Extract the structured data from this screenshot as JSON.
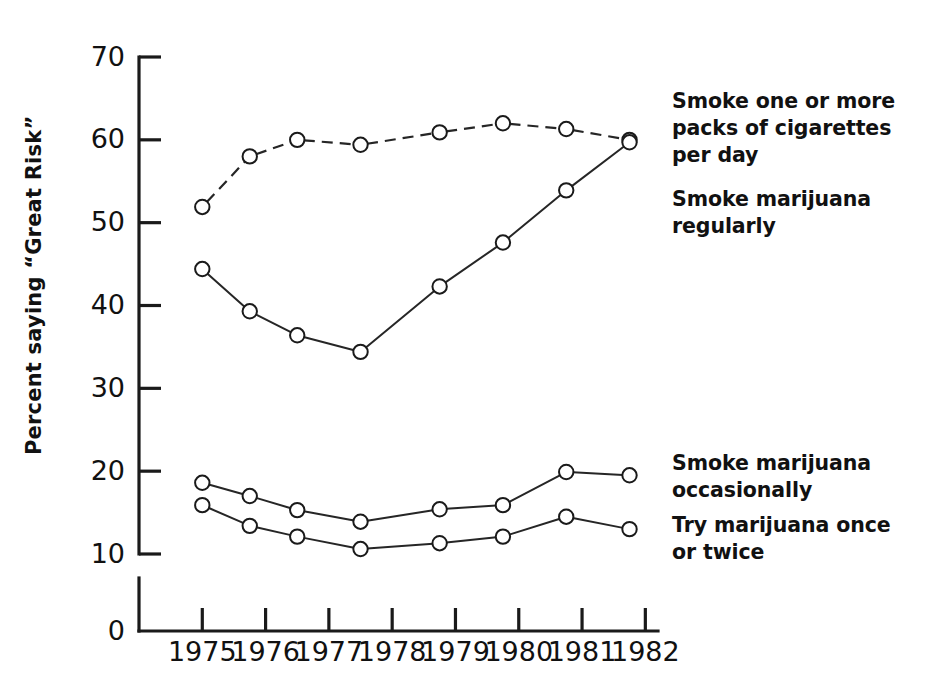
{
  "chart_data": {
    "type": "line",
    "title": "",
    "xlabel": "",
    "ylabel": "Percent saying “Great Risk”",
    "xlim": [
      1974.0,
      1982.2
    ],
    "ylim": [
      0,
      70
    ],
    "y_axis_break": true,
    "grid": false,
    "legend_position": "right",
    "xticks": [
      1975,
      1976,
      1977,
      1978,
      1979,
      1980,
      1981,
      1982
    ],
    "xtick_labels": [
      "1975",
      "1976",
      "1977",
      "1978",
      "1979",
      "1980",
      "1981",
      "1982"
    ],
    "yticks": [
      0,
      10,
      20,
      30,
      40,
      50,
      60,
      70
    ],
    "ytick_labels": [
      "0",
      "10",
      "20",
      "30",
      "40",
      "50",
      "60",
      "70"
    ],
    "series": [
      {
        "name": "Smoke one or more packs of cigarettes per day",
        "style": "dashed",
        "x": [
          1975.0,
          1975.75,
          1976.5,
          1977.5,
          1978.75,
          1979.75,
          1980.75,
          1981.75
        ],
        "values": [
          51.9,
          58.0,
          60.0,
          59.4,
          60.9,
          62.0,
          61.3,
          60.0
        ]
      },
      {
        "name": "Smoke marijuana regularly",
        "style": "solid",
        "x": [
          1975.0,
          1975.75,
          1976.5,
          1977.5,
          1978.75,
          1979.75,
          1980.75,
          1981.75
        ],
        "values": [
          44.4,
          39.3,
          36.4,
          34.4,
          42.3,
          47.6,
          53.9,
          59.7
        ]
      },
      {
        "name": "Smoke marijuana occasionally",
        "style": "solid",
        "x": [
          1975.0,
          1975.75,
          1976.5,
          1977.5,
          1978.75,
          1979.75,
          1980.75,
          1981.75
        ],
        "values": [
          18.6,
          17.0,
          15.3,
          13.9,
          15.4,
          15.9,
          19.9,
          19.5
        ]
      },
      {
        "name": "Try marijuana once or twice",
        "style": "solid",
        "x": [
          1975.0,
          1975.75,
          1976.5,
          1977.5,
          1978.75,
          1979.75,
          1980.75,
          1981.75
        ],
        "values": [
          15.9,
          13.4,
          12.1,
          10.6,
          11.3,
          12.1,
          14.5,
          13.0
        ]
      }
    ]
  },
  "axis": {
    "y_title": "Percent saying “Great Risk”"
  },
  "legend": {
    "cigarettes": "Smoke one or more\npacks of cigarettes\nper day",
    "marijuana_regularly": "Smoke marijuana\nregularly",
    "marijuana_occasionally": "Smoke marijuana\noccasionally",
    "marijuana_try": "Try marijuana once\nor twice"
  },
  "colors": {
    "background": "#ffffff",
    "ink": "#1a1a1a",
    "line": "#262626",
    "marker_fill": "#ffffff"
  }
}
